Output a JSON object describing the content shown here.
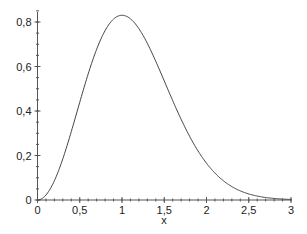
{
  "chart_data": {
    "type": "line",
    "title": "",
    "xlabel": "x",
    "ylabel": "",
    "xlim": [
      0,
      3
    ],
    "ylim": [
      0,
      0.85
    ],
    "grid": false,
    "legend": null,
    "x_ticks": [
      "0",
      "0,5",
      "1",
      "1,5",
      "2",
      "2,5",
      "3"
    ],
    "x_tick_values": [
      0,
      0.5,
      1,
      1.5,
      2,
      2.5,
      3
    ],
    "y_ticks": [
      "0",
      "0,2",
      "0,4",
      "0,6",
      "0,8"
    ],
    "y_tick_values": [
      0,
      0.2,
      0.4,
      0.6,
      0.8
    ],
    "series": [
      {
        "name": "f(x)",
        "x": [
          0,
          0.1,
          0.2,
          0.3,
          0.4,
          0.5,
          0.6,
          0.7,
          0.8,
          0.9,
          1.0,
          1.1,
          1.2,
          1.3,
          1.4,
          1.5,
          1.6,
          1.7,
          1.8,
          1.9,
          2.0,
          2.1,
          2.2,
          2.3,
          2.4,
          2.5,
          2.6,
          2.7,
          2.8,
          2.9,
          3.0
        ],
        "values": [
          0,
          0.022,
          0.087,
          0.185,
          0.307,
          0.439,
          0.568,
          0.679,
          0.763,
          0.814,
          0.83,
          0.812,
          0.766,
          0.698,
          0.617,
          0.532,
          0.446,
          0.365,
          0.292,
          0.229,
          0.165,
          0.121,
          0.087,
          0.06,
          0.041,
          0.027,
          0.018,
          0.011,
          0.007,
          0.004,
          0.002
        ]
      }
    ]
  }
}
